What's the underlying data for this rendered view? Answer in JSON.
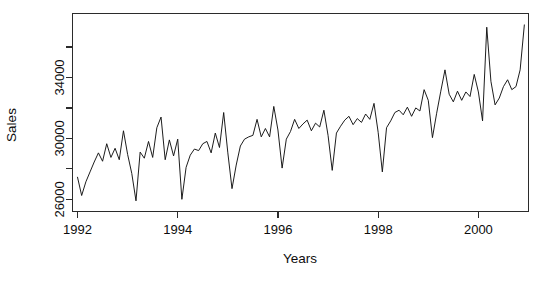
{
  "chart_data": {
    "type": "line",
    "title": "",
    "xlabel": "Years",
    "ylabel": "Sales",
    "xlim": [
      1991.9,
      2001.0
    ],
    "ylim": [
      25200,
      38200
    ],
    "grid": false,
    "legend": null,
    "x_ticks": [
      1992,
      1994,
      1996,
      1998,
      2000
    ],
    "x_tick_labels": [
      "1992",
      "1994",
      "1996",
      "1998",
      "2000"
    ],
    "x_minor_ticks": [
      1993,
      1995,
      1997,
      1999,
      2001
    ],
    "y_ticks": [
      26000,
      28000,
      30000,
      32000,
      34000,
      36000
    ],
    "y_tick_labels": [
      "26000",
      "",
      "30000",
      "",
      "34000",
      ""
    ],
    "y_labeled_ticks": [
      26000,
      30000,
      34000
    ],
    "series": [
      {
        "name": "Sales",
        "x": [
          1992.0,
          1992.083,
          1992.167,
          1992.25,
          1992.333,
          1992.417,
          1992.5,
          1992.583,
          1992.667,
          1992.75,
          1992.833,
          1992.917,
          1993.0,
          1993.083,
          1993.167,
          1993.25,
          1993.333,
          1993.417,
          1993.5,
          1993.583,
          1993.667,
          1993.75,
          1993.833,
          1993.917,
          1994.0,
          1994.083,
          1994.167,
          1994.25,
          1994.333,
          1994.417,
          1994.5,
          1994.583,
          1994.667,
          1994.75,
          1994.833,
          1994.917,
          1995.0,
          1995.083,
          1995.167,
          1995.25,
          1995.333,
          1995.417,
          1995.5,
          1995.583,
          1995.667,
          1995.75,
          1995.833,
          1995.917,
          1996.0,
          1996.083,
          1996.167,
          1996.25,
          1996.333,
          1996.417,
          1996.5,
          1996.583,
          1996.667,
          1996.75,
          1996.833,
          1996.917,
          1997.0,
          1997.083,
          1997.167,
          1997.25,
          1997.333,
          1997.417,
          1997.5,
          1997.583,
          1997.667,
          1997.75,
          1997.833,
          1997.917,
          1998.0,
          1998.083,
          1998.167,
          1998.25,
          1998.333,
          1998.417,
          1998.5,
          1998.583,
          1998.667,
          1998.75,
          1998.833,
          1998.917,
          1999.0,
          1999.083,
          1999.167,
          1999.25,
          1999.333,
          1999.417,
          1999.5,
          1999.583,
          1999.667,
          1999.75,
          1999.833,
          1999.917,
          2000.0,
          2000.083,
          2000.167,
          2000.25,
          2000.333,
          2000.417,
          2000.5,
          2000.583,
          2000.667,
          2000.75,
          2000.833,
          2000.917
        ],
        "values": [
          27450,
          26250,
          27150,
          27800,
          28450,
          29050,
          28500,
          29650,
          28750,
          29350,
          28600,
          30500,
          28950,
          27700,
          25900,
          29100,
          28700,
          29800,
          28750,
          30700,
          31400,
          28600,
          29900,
          28850,
          29950,
          26000,
          28100,
          28900,
          29300,
          29200,
          29650,
          29800,
          29050,
          30350,
          29400,
          31700,
          29050,
          26700,
          28250,
          29500,
          29950,
          30100,
          30200,
          31250,
          30100,
          30650,
          30100,
          32100,
          30550,
          28050,
          29950,
          30450,
          31250,
          30650,
          30950,
          31200,
          30500,
          31000,
          30750,
          31850,
          30200,
          27900,
          30350,
          30800,
          31200,
          31450,
          30900,
          31300,
          31050,
          31600,
          31250,
          32300,
          30400,
          27800,
          30700,
          31150,
          31700,
          31850,
          31550,
          32050,
          31450,
          32000,
          31800,
          33200,
          32500,
          30050,
          31650,
          33100,
          34500,
          32900,
          32400,
          33100,
          32500,
          33050,
          32750,
          34200,
          33050,
          31150,
          37300,
          33750,
          32200,
          32650,
          33400,
          33850,
          33200,
          33400,
          34500,
          37450
        ]
      }
    ]
  },
  "figure": {
    "y_axis_title": "Sales",
    "x_axis_title": "Years"
  }
}
